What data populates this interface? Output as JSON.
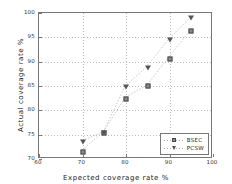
{
  "chart_data": {
    "type": "scatter",
    "title": "",
    "xlabel": "Expected coverage rate %",
    "ylabel": "Actual coverage rate %",
    "xlim": [
      60,
      100
    ],
    "ylim": [
      70,
      100
    ],
    "xticks": [
      60,
      70,
      80,
      90,
      100
    ],
    "yticks": [
      70,
      75,
      80,
      85,
      90,
      95,
      100
    ],
    "xticklabels": [
      "60",
      "70",
      "80",
      "90",
      "100"
    ],
    "yticklabels": [
      "70",
      "75",
      "80",
      "85",
      "90",
      "95",
      "100"
    ],
    "grid": true,
    "grid_style": "dotted",
    "legend_position": "lower right",
    "x": [
      70,
      75,
      80,
      85,
      90,
      95
    ],
    "series": [
      {
        "name": "BSEC",
        "marker": "square",
        "color": "#8a8a8a",
        "values": [
          71.4,
          75.3,
          82.4,
          84.9,
          90.6,
          96.2
        ]
      },
      {
        "name": "PCSW",
        "marker": "triangle-down",
        "color": "#555555",
        "values": [
          73.4,
          75.3,
          84.7,
          88.8,
          94.4,
          98.9
        ]
      }
    ]
  },
  "legend": {
    "entries": [
      {
        "label": "BSEC",
        "marker": "square-marker-icon"
      },
      {
        "label": "PCSW",
        "marker": "triangle-down-marker-icon"
      }
    ]
  },
  "colors": {
    "axis": "#777777",
    "grid": "#bdbdbd",
    "background": "#ffffff",
    "text": "#222222"
  }
}
